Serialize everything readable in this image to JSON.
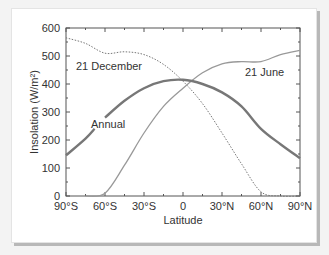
{
  "chart_data": {
    "type": "line",
    "title": "",
    "xlabel": "Latitude",
    "ylabel": "Insolation (W/m²)",
    "xlim": [
      -90,
      90
    ],
    "ylim": [
      0,
      600
    ],
    "x_ticks": [
      -90,
      -60,
      -30,
      0,
      30,
      60,
      90
    ],
    "x_tick_labels": [
      "90°S",
      "60°S",
      "30°S",
      "0",
      "30°N",
      "60°N",
      "90°N"
    ],
    "y_ticks": [
      0,
      100,
      200,
      300,
      400,
      500,
      600
    ],
    "y_tick_labels": [
      "0",
      "100",
      "200",
      "300",
      "400",
      "500",
      "600"
    ],
    "grid": false,
    "legend": "inline annotations",
    "x": [
      -90,
      -75,
      -60,
      -45,
      -30,
      -15,
      0,
      15,
      30,
      45,
      60,
      75,
      90
    ],
    "series": [
      {
        "name": "21 December",
        "style": "dotted",
        "values": [
          565,
          545,
          510,
          515,
          505,
          470,
          410,
          330,
          225,
          115,
          15,
          0,
          0
        ]
      },
      {
        "name": "21 June",
        "style": "solid thin",
        "values": [
          0,
          0,
          10,
          110,
          225,
          320,
          385,
          440,
          472,
          480,
          480,
          505,
          520
        ]
      },
      {
        "name": "Annual",
        "style": "solid thick",
        "values": [
          145,
          205,
          280,
          340,
          385,
          410,
          415,
          400,
          370,
          320,
          240,
          185,
          135
        ]
      }
    ],
    "annotations": [
      {
        "text": "21 December",
        "x": -75,
        "y": 480
      },
      {
        "text": "21 June",
        "x": 75,
        "y": 440
      },
      {
        "text": "Annual",
        "x": -60,
        "y": 265
      }
    ]
  },
  "labels": {
    "xlabel": "Latitude",
    "ylabel": "Insolation (W/m²)",
    "dec": "21 December",
    "jun": "21 June",
    "annual": "Annual"
  },
  "ticks": {
    "x": [
      "90°S",
      "60°S",
      "30°S",
      "0",
      "30°N",
      "60°N",
      "90°N"
    ],
    "y": [
      "0",
      "100",
      "200",
      "300",
      "400",
      "500",
      "600"
    ]
  }
}
